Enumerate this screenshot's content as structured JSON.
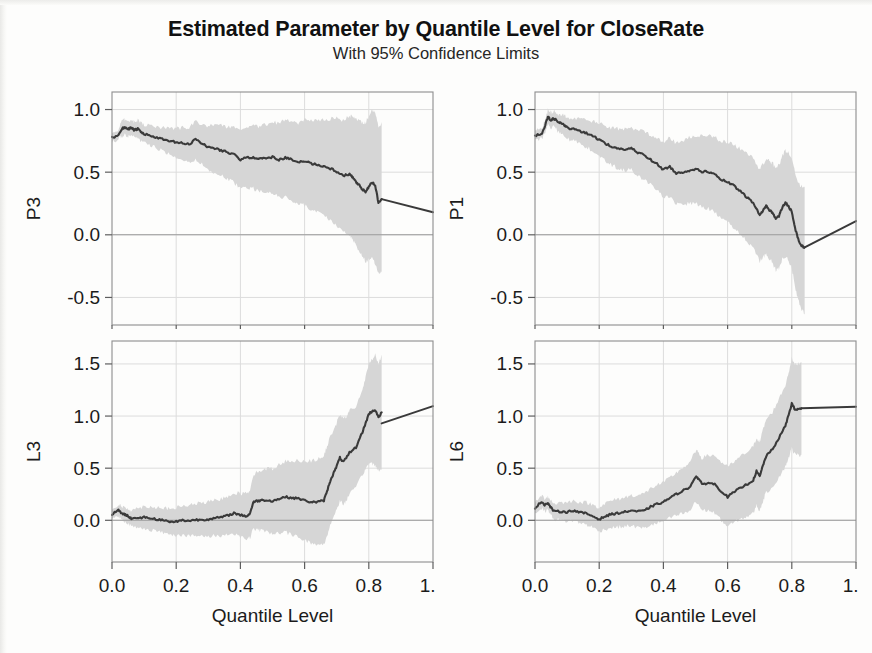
{
  "title": "Estimated Parameter by Quantile Level for CloseRate",
  "subtitle": "With 95% Confidence Limits",
  "axis": {
    "xlabel": "Quantile Level",
    "xticks": [
      "0.0",
      "0.2",
      "0.4",
      "0.6",
      "0.8",
      "1.0"
    ]
  },
  "colors": {
    "band": "#d6d6d6",
    "line": "#3a3a3a",
    "frame": "#8d8d8d",
    "grid": "#dcdcdc",
    "text": "#1b1b1b"
  },
  "chart_data": [
    {
      "type": "line",
      "panel": "top-left",
      "title": "Estimated Parameter by Quantile Level for CloseRate",
      "subtitle": "With 95% Confidence Limits",
      "ylabel": "P3",
      "xlabel": "Quantile Level",
      "xlim": [
        0.0,
        1.0
      ],
      "ylim": [
        -0.72,
        1.14
      ],
      "xticks": [
        0.0,
        0.2,
        0.4,
        0.6,
        0.8,
        1.0
      ],
      "yticks": [
        -0.5,
        0.0,
        0.5,
        1.0
      ],
      "ytick_labels": [
        "-0.5",
        "0.0",
        "0.5",
        "1.0"
      ],
      "grid": true,
      "zero_reference_line": 0.0,
      "band_end_x": 0.84,
      "legend": null,
      "x": [
        0.0,
        0.02,
        0.03,
        0.04,
        0.05,
        0.06,
        0.07,
        0.08,
        0.09,
        0.1,
        0.12,
        0.14,
        0.16,
        0.18,
        0.2,
        0.22,
        0.24,
        0.26,
        0.28,
        0.3,
        0.32,
        0.34,
        0.36,
        0.38,
        0.4,
        0.42,
        0.44,
        0.46,
        0.48,
        0.5,
        0.52,
        0.54,
        0.56,
        0.58,
        0.6,
        0.62,
        0.64,
        0.66,
        0.68,
        0.7,
        0.72,
        0.74,
        0.75,
        0.76,
        0.77,
        0.78,
        0.79,
        0.8,
        0.81,
        0.82,
        0.83,
        0.84
      ],
      "series": [
        {
          "name": "estimate",
          "values": [
            0.775,
            0.795,
            0.845,
            0.86,
            0.845,
            0.855,
            0.835,
            0.845,
            0.82,
            0.805,
            0.79,
            0.775,
            0.76,
            0.745,
            0.74,
            0.73,
            0.72,
            0.765,
            0.73,
            0.7,
            0.69,
            0.675,
            0.66,
            0.64,
            0.6,
            0.615,
            0.62,
            0.605,
            0.615,
            0.62,
            0.6,
            0.615,
            0.6,
            0.575,
            0.59,
            0.57,
            0.56,
            0.545,
            0.53,
            0.505,
            0.47,
            0.485,
            0.455,
            0.42,
            0.395,
            0.36,
            0.345,
            0.38,
            0.42,
            0.395,
            0.255,
            0.285
          ]
        },
        {
          "name": "lower_95",
          "values": [
            0.745,
            0.76,
            0.79,
            0.8,
            0.79,
            0.795,
            0.775,
            0.78,
            0.75,
            0.735,
            0.71,
            0.69,
            0.67,
            0.645,
            0.625,
            0.6,
            0.58,
            0.6,
            0.56,
            0.52,
            0.495,
            0.47,
            0.45,
            0.415,
            0.37,
            0.375,
            0.37,
            0.345,
            0.34,
            0.33,
            0.305,
            0.3,
            0.275,
            0.24,
            0.235,
            0.205,
            0.18,
            0.15,
            0.12,
            0.075,
            0.02,
            0.0,
            -0.04,
            -0.09,
            -0.13,
            -0.18,
            -0.21,
            -0.2,
            -0.18,
            -0.23,
            -0.31,
            -0.3
          ]
        },
        {
          "name": "upper_95",
          "values": [
            0.805,
            0.835,
            0.9,
            0.92,
            0.905,
            0.915,
            0.9,
            0.915,
            0.89,
            0.88,
            0.87,
            0.86,
            0.855,
            0.845,
            0.85,
            0.855,
            0.855,
            0.9,
            0.88,
            0.87,
            0.875,
            0.87,
            0.865,
            0.855,
            0.83,
            0.855,
            0.87,
            0.865,
            0.885,
            0.9,
            0.89,
            0.915,
            0.91,
            0.895,
            0.925,
            0.915,
            0.92,
            0.92,
            0.925,
            0.93,
            0.91,
            0.95,
            0.94,
            0.92,
            0.915,
            0.895,
            0.895,
            0.945,
            1.0,
            0.985,
            0.86,
            0.9
          ]
        }
      ],
      "extrapolation": {
        "x": [
          0.84,
          1.0
        ],
        "values": [
          0.285,
          0.18
        ]
      }
    },
    {
      "type": "line",
      "panel": "top-right",
      "ylabel": "P1",
      "xlabel": "Quantile Level",
      "xlim": [
        0.0,
        1.0
      ],
      "ylim": [
        -0.72,
        1.14
      ],
      "xticks": [
        0.0,
        0.2,
        0.4,
        0.6,
        0.8,
        1.0
      ],
      "yticks": [
        -0.5,
        0.0,
        0.5,
        1.0
      ],
      "ytick_labels": [
        "-0.5",
        "0.0",
        "0.5",
        "1.0"
      ],
      "grid": true,
      "zero_reference_line": 0.0,
      "band_end_x": 0.84,
      "x": [
        0.0,
        0.02,
        0.03,
        0.04,
        0.05,
        0.06,
        0.07,
        0.08,
        0.09,
        0.1,
        0.12,
        0.14,
        0.16,
        0.18,
        0.2,
        0.22,
        0.24,
        0.26,
        0.28,
        0.3,
        0.32,
        0.34,
        0.36,
        0.38,
        0.4,
        0.42,
        0.44,
        0.46,
        0.48,
        0.5,
        0.52,
        0.54,
        0.56,
        0.58,
        0.6,
        0.62,
        0.64,
        0.66,
        0.68,
        0.7,
        0.71,
        0.72,
        0.73,
        0.74,
        0.75,
        0.76,
        0.77,
        0.78,
        0.79,
        0.8,
        0.81,
        0.82,
        0.83,
        0.84
      ],
      "series": [
        {
          "name": "estimate",
          "values": [
            0.795,
            0.8,
            0.86,
            0.94,
            0.915,
            0.93,
            0.9,
            0.89,
            0.88,
            0.855,
            0.845,
            0.83,
            0.81,
            0.79,
            0.76,
            0.73,
            0.7,
            0.69,
            0.68,
            0.69,
            0.655,
            0.64,
            0.6,
            0.565,
            0.52,
            0.545,
            0.49,
            0.5,
            0.515,
            0.525,
            0.505,
            0.505,
            0.48,
            0.44,
            0.42,
            0.39,
            0.345,
            0.3,
            0.255,
            0.155,
            0.195,
            0.23,
            0.2,
            0.175,
            0.13,
            0.15,
            0.215,
            0.255,
            0.23,
            0.18,
            0.055,
            -0.035,
            -0.085,
            -0.1
          ]
        },
        {
          "name": "lower_95",
          "values": [
            0.76,
            0.765,
            0.81,
            0.88,
            0.855,
            0.865,
            0.83,
            0.815,
            0.8,
            0.77,
            0.75,
            0.725,
            0.7,
            0.67,
            0.63,
            0.59,
            0.555,
            0.53,
            0.515,
            0.52,
            0.47,
            0.445,
            0.4,
            0.355,
            0.3,
            0.31,
            0.245,
            0.245,
            0.25,
            0.25,
            0.22,
            0.21,
            0.175,
            0.13,
            0.1,
            0.06,
            0.005,
            -0.05,
            -0.105,
            -0.215,
            -0.18,
            -0.15,
            -0.19,
            -0.225,
            -0.28,
            -0.265,
            -0.2,
            -0.17,
            -0.205,
            -0.27,
            -0.41,
            -0.52,
            -0.59,
            -0.63
          ]
        },
        {
          "name": "upper_95",
          "values": [
            0.83,
            0.84,
            0.905,
            0.995,
            0.975,
            0.99,
            0.965,
            0.96,
            0.955,
            0.935,
            0.93,
            0.925,
            0.915,
            0.905,
            0.89,
            0.87,
            0.85,
            0.845,
            0.84,
            0.855,
            0.835,
            0.83,
            0.8,
            0.775,
            0.74,
            0.775,
            0.73,
            0.75,
            0.775,
            0.795,
            0.785,
            0.795,
            0.78,
            0.75,
            0.74,
            0.72,
            0.685,
            0.65,
            0.615,
            0.52,
            0.565,
            0.605,
            0.585,
            0.57,
            0.535,
            0.56,
            0.625,
            0.67,
            0.655,
            0.615,
            0.5,
            0.42,
            0.385,
            0.38
          ]
        }
      ],
      "extrapolation": {
        "x": [
          0.84,
          1.0
        ],
        "values": [
          -0.1,
          0.11
        ]
      }
    },
    {
      "type": "line",
      "panel": "bottom-left",
      "ylabel": "L3",
      "xlabel": "Quantile Level",
      "xlim": [
        0.0,
        1.0
      ],
      "ylim": [
        -0.4,
        1.72
      ],
      "xticks": [
        0.0,
        0.2,
        0.4,
        0.6,
        0.8,
        1.0
      ],
      "yticks": [
        0.0,
        0.5,
        1.0,
        1.5
      ],
      "ytick_labels": [
        "0.0",
        "0.5",
        "1.0",
        "1.5"
      ],
      "grid": true,
      "zero_reference_line": 0.0,
      "band_end_x": 0.84,
      "x": [
        0.0,
        0.02,
        0.03,
        0.04,
        0.05,
        0.06,
        0.08,
        0.1,
        0.12,
        0.14,
        0.16,
        0.18,
        0.2,
        0.22,
        0.24,
        0.26,
        0.28,
        0.3,
        0.32,
        0.34,
        0.36,
        0.38,
        0.4,
        0.42,
        0.43,
        0.44,
        0.45,
        0.46,
        0.48,
        0.5,
        0.52,
        0.54,
        0.56,
        0.58,
        0.6,
        0.62,
        0.64,
        0.66,
        0.67,
        0.68,
        0.69,
        0.7,
        0.71,
        0.72,
        0.73,
        0.74,
        0.76,
        0.78,
        0.79,
        0.8,
        0.81,
        0.82,
        0.83,
        0.84
      ],
      "series": [
        {
          "name": "estimate",
          "values": [
            0.06,
            0.095,
            0.07,
            0.055,
            0.04,
            0.02,
            0.02,
            0.03,
            0.02,
            0.01,
            0.0,
            -0.015,
            -0.01,
            0.0,
            -0.005,
            0.005,
            0.005,
            0.01,
            0.02,
            0.03,
            0.045,
            0.07,
            0.05,
            0.04,
            0.065,
            0.175,
            0.185,
            0.19,
            0.195,
            0.185,
            0.205,
            0.225,
            0.215,
            0.21,
            0.19,
            0.175,
            0.175,
            0.19,
            0.28,
            0.38,
            0.45,
            0.52,
            0.6,
            0.56,
            0.595,
            0.65,
            0.7,
            0.845,
            0.93,
            1.02,
            1.045,
            1.06,
            0.985,
            1.035
          ]
        },
        {
          "name": "lower_95",
          "values": [
            0.02,
            0.04,
            0.01,
            -0.01,
            -0.03,
            -0.06,
            -0.075,
            -0.075,
            -0.09,
            -0.105,
            -0.12,
            -0.135,
            -0.14,
            -0.14,
            -0.15,
            -0.15,
            -0.155,
            -0.155,
            -0.15,
            -0.145,
            -0.14,
            -0.125,
            -0.155,
            -0.18,
            -0.165,
            -0.085,
            -0.09,
            -0.095,
            -0.105,
            -0.125,
            -0.125,
            -0.115,
            -0.14,
            -0.155,
            -0.19,
            -0.22,
            -0.235,
            -0.235,
            -0.15,
            -0.04,
            0.03,
            0.105,
            0.19,
            0.15,
            0.19,
            0.25,
            0.31,
            0.44,
            0.49,
            0.545,
            0.545,
            0.53,
            0.475,
            0.48
          ]
        },
        {
          "name": "upper_95",
          "values": [
            0.1,
            0.15,
            0.13,
            0.12,
            0.11,
            0.1,
            0.115,
            0.135,
            0.13,
            0.125,
            0.12,
            0.105,
            0.12,
            0.14,
            0.14,
            0.16,
            0.165,
            0.175,
            0.19,
            0.205,
            0.23,
            0.265,
            0.255,
            0.26,
            0.295,
            0.435,
            0.46,
            0.475,
            0.495,
            0.495,
            0.535,
            0.565,
            0.57,
            0.575,
            0.57,
            0.57,
            0.585,
            0.615,
            0.71,
            0.8,
            0.87,
            0.935,
            1.01,
            0.97,
            1.0,
            1.05,
            1.09,
            1.25,
            1.37,
            1.495,
            1.545,
            1.59,
            1.495,
            1.59
          ]
        }
      ],
      "extrapolation": {
        "x": [
          0.84,
          1.0
        ],
        "values": [
          0.93,
          1.095
        ]
      }
    },
    {
      "type": "line",
      "panel": "bottom-right",
      "ylabel": "L6",
      "xlabel": "Quantile Level",
      "xlim": [
        0.0,
        1.0
      ],
      "ylim": [
        -0.4,
        1.72
      ],
      "xticks": [
        0.0,
        0.2,
        0.4,
        0.6,
        0.8,
        1.0
      ],
      "yticks": [
        0.0,
        0.5,
        1.0,
        1.5
      ],
      "ytick_labels": [
        "0.0",
        "0.5",
        "1.0",
        "1.5"
      ],
      "grid": true,
      "zero_reference_line": 0.0,
      "band_end_x": 0.83,
      "x": [
        0.0,
        0.02,
        0.03,
        0.04,
        0.05,
        0.06,
        0.08,
        0.1,
        0.12,
        0.14,
        0.16,
        0.18,
        0.2,
        0.22,
        0.24,
        0.26,
        0.28,
        0.3,
        0.32,
        0.34,
        0.36,
        0.38,
        0.4,
        0.42,
        0.44,
        0.46,
        0.48,
        0.5,
        0.51,
        0.52,
        0.54,
        0.56,
        0.58,
        0.6,
        0.62,
        0.64,
        0.66,
        0.68,
        0.69,
        0.7,
        0.71,
        0.72,
        0.74,
        0.76,
        0.78,
        0.79,
        0.8,
        0.81,
        0.82,
        0.83
      ],
      "series": [
        {
          "name": "estimate",
          "values": [
            0.115,
            0.18,
            0.15,
            0.165,
            0.12,
            0.085,
            0.085,
            0.08,
            0.095,
            0.075,
            0.065,
            0.04,
            0.01,
            0.04,
            0.06,
            0.07,
            0.08,
            0.095,
            0.085,
            0.09,
            0.13,
            0.155,
            0.175,
            0.215,
            0.25,
            0.285,
            0.31,
            0.42,
            0.4,
            0.345,
            0.36,
            0.345,
            0.28,
            0.225,
            0.27,
            0.31,
            0.345,
            0.385,
            0.47,
            0.42,
            0.525,
            0.615,
            0.68,
            0.79,
            0.905,
            1.01,
            1.12,
            1.06,
            1.065,
            1.075
          ]
        },
        {
          "name": "lower_95",
          "values": [
            0.065,
            0.12,
            0.09,
            0.1,
            0.05,
            0.01,
            0.0,
            -0.01,
            0.0,
            -0.025,
            -0.04,
            -0.07,
            -0.105,
            -0.085,
            -0.07,
            -0.065,
            -0.06,
            -0.05,
            -0.07,
            -0.075,
            -0.045,
            -0.03,
            -0.01,
            0.02,
            0.045,
            0.065,
            0.08,
            0.175,
            0.15,
            0.095,
            0.095,
            0.07,
            0.0,
            -0.06,
            -0.02,
            0.01,
            0.035,
            0.065,
            0.145,
            0.09,
            0.185,
            0.265,
            0.32,
            0.415,
            0.515,
            0.6,
            0.69,
            0.63,
            0.625,
            0.63
          ]
        },
        {
          "name": "upper_95",
          "values": [
            0.165,
            0.24,
            0.21,
            0.23,
            0.19,
            0.16,
            0.17,
            0.17,
            0.19,
            0.175,
            0.17,
            0.15,
            0.125,
            0.165,
            0.19,
            0.205,
            0.22,
            0.24,
            0.24,
            0.255,
            0.305,
            0.34,
            0.36,
            0.41,
            0.455,
            0.505,
            0.54,
            0.665,
            0.65,
            0.595,
            0.625,
            0.62,
            0.56,
            0.51,
            0.56,
            0.61,
            0.655,
            0.705,
            0.795,
            0.75,
            0.865,
            0.965,
            1.04,
            1.165,
            1.295,
            1.42,
            1.55,
            1.49,
            1.505,
            1.52
          ]
        }
      ],
      "extrapolation": {
        "x": [
          0.83,
          1.0
        ],
        "values": [
          1.075,
          1.09
        ]
      }
    }
  ]
}
